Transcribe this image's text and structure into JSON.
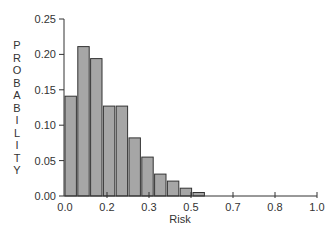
{
  "chart_data": {
    "type": "bar",
    "title": "",
    "xlabel": "Risk",
    "ylabel": "PROBABILITY",
    "xlim": [
      0.0,
      1.0
    ],
    "ylim": [
      0.0,
      0.25
    ],
    "grid": false,
    "legend": null,
    "x_tick_labels": [
      "0.0",
      "0.2",
      "0.3",
      "0.5",
      "0.7",
      "0.8",
      "1.0"
    ],
    "y_tick_labels": [
      "0.00",
      "0.05",
      "0.10",
      "0.15",
      "0.20",
      "0.25"
    ],
    "bin_width": 0.03,
    "categories": [
      "0.00-0.03",
      "0.03-0.06",
      "0.06-0.09",
      "0.09-0.12",
      "0.12-0.15",
      "0.15-0.18",
      "0.18-0.21",
      "0.21-0.24",
      "0.24-0.27",
      "0.27-0.30",
      "0.30-0.33"
    ],
    "values": [
      0.141,
      0.211,
      0.194,
      0.127,
      0.127,
      0.082,
      0.055,
      0.031,
      0.021,
      0.011,
      0.005
    ],
    "bar_color": "#a6a6a6",
    "bar_edge_color": "#333333"
  }
}
